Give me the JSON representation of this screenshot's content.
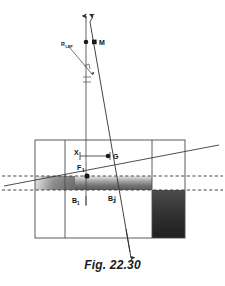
{
  "figure": {
    "caption": "Fig. 22.30",
    "points": {
      "metacentre": "M",
      "point_x": "X",
      "centre_of_gravity": "G",
      "buoyancy_f1": "F",
      "buoyancy_f1_sub": "1",
      "buoyancy_b1": "B",
      "buoyancy_b1_sub": "1",
      "buoyancy_b2": "B",
      "buoyancy_b2_sub": "2",
      "force_label": "R",
      "force_label_sub": "LBP"
    },
    "colors": {
      "outline": "#4a4a4a",
      "line": "#3a3a3a",
      "dashed": "#333333",
      "shade_dark": "#2e2e2e",
      "shade_mid": "#6e6e6e",
      "shade_light": "#d8d8d8",
      "text": "#111111",
      "background": "#ffffff"
    }
  }
}
